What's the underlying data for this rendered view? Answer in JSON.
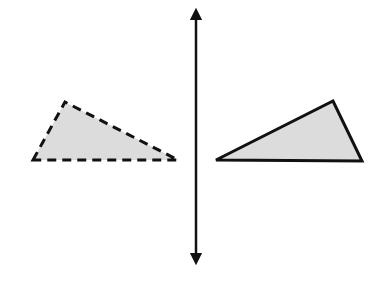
{
  "diagram": {
    "title": "",
    "colors": {
      "background": "#ffffff",
      "stroke": "#111111",
      "fill": "#dcdcdc"
    },
    "mirror_line": {
      "x": 196,
      "y_top": 8,
      "y_bottom": 265,
      "arrows": "both"
    },
    "preimage_triangle": {
      "style": "solid",
      "vertices": [
        [
          216,
          160
        ],
        [
          333,
          101
        ],
        [
          362,
          161
        ]
      ]
    },
    "image_triangle": {
      "style": "dashed",
      "vertices": [
        [
          33,
          160
        ],
        [
          65,
          102
        ],
        [
          178,
          160
        ]
      ]
    }
  }
}
